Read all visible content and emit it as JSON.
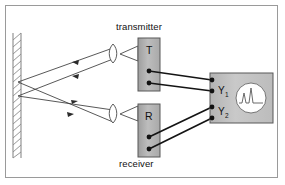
{
  "figure": {
    "title_visible": false,
    "type": "optics-wave-reflection-schematic",
    "background_color": "#ffffff",
    "frame_border_color": "#9a9a9a"
  },
  "labels": {
    "transmitter": "transmitter",
    "receiver": "receiver",
    "transmitter_box": "T",
    "receiver_box": "R",
    "scope_channel_1": "Y",
    "scope_channel_1_sub": "1",
    "scope_channel_2": "Y",
    "scope_channel_2_sub": "2"
  },
  "components": {
    "wall": {
      "name": "hatched-wall",
      "hatch_count": 18,
      "color": "#777777"
    },
    "transmitter_unit": {
      "box_label": "T",
      "box_fill": "#b5b5b5",
      "box_stroke": "#555555",
      "terminals": 2,
      "lens": "biconvex-lens",
      "horn": "triangular-horn"
    },
    "receiver_unit": {
      "box_label": "R",
      "box_fill": "#b5b5b5",
      "box_stroke": "#555555",
      "terminals": 2,
      "lens": "biconvex-lens",
      "horn": "triangular-horn"
    },
    "oscilloscope": {
      "box_fill": "#c4c4c4",
      "box_stroke": "#555555",
      "input_terminals": 4,
      "screen": "circular-crt-screen",
      "waveform": "double-peak-trace"
    }
  },
  "beams": {
    "count": 4,
    "arrow_direction": "toward-wall-and-back",
    "stroke_color": "#3a3a3a",
    "description": "two outgoing beams from transmitter to wall and two reflected beams to receiver, crossing near the wall"
  },
  "cables": {
    "count": 4,
    "stroke_color": "#1a1a1a",
    "description": "two thick leads from T terminals to Y1 inputs and two from R terminals to Y2 inputs"
  },
  "colors": {
    "box_gray": "#b5b5b5",
    "scope_gray": "#c4c4c4",
    "line_dark": "#2b2b2b",
    "wall_gray": "#777777"
  }
}
